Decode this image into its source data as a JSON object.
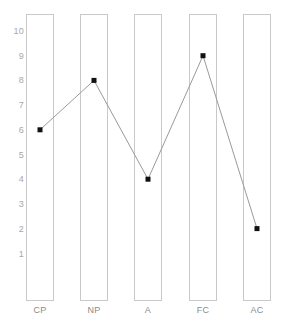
{
  "chart_data": {
    "type": "line",
    "title": "",
    "subtitle": "",
    "xlabel": "",
    "ylabel": "",
    "categories": [
      "CP",
      "NP",
      "A",
      "FC",
      "AC"
    ],
    "values": [
      6,
      8,
      4,
      9,
      2
    ],
    "series": [
      {
        "name": "egogram",
        "values": [
          6,
          8,
          4,
          9,
          2
        ]
      }
    ],
    "ylim": [
      0,
      10.5
    ],
    "y_ticks": [
      10,
      9,
      8,
      7,
      6,
      5,
      4,
      3,
      2,
      1
    ],
    "y_tick_labels": [
      "10",
      "9",
      "8",
      "7",
      "6",
      "5",
      "4",
      "3",
      "2",
      "1"
    ],
    "grid": false,
    "legend": "none",
    "marker": "square",
    "colors": {
      "line": "#9a9a9a",
      "marker": "#111111",
      "column_border": "#c9c9c9",
      "y_tick_text": "#a8a8a8",
      "x_tick_text": "#8a8a8a",
      "background": "#ffffff"
    }
  },
  "axes": {
    "y_ticks": [
      {
        "label": "10",
        "value": 10
      },
      {
        "label": "9",
        "value": 9
      },
      {
        "label": "8",
        "value": 8
      },
      {
        "label": "7",
        "value": 7
      },
      {
        "label": "6",
        "value": 6
      },
      {
        "label": "5",
        "value": 5
      },
      {
        "label": "4",
        "value": 4
      },
      {
        "label": "3",
        "value": 3
      },
      {
        "label": "2",
        "value": 2
      },
      {
        "label": "1",
        "value": 1
      }
    ],
    "x_ticks": [
      {
        "label": "CP",
        "value": 6
      },
      {
        "label": "NP",
        "value": 8
      },
      {
        "label": "A",
        "value": 4
      },
      {
        "label": "FC",
        "value": 9
      },
      {
        "label": "AC",
        "value": 2
      }
    ]
  },
  "caption": {
    "text": ""
  }
}
